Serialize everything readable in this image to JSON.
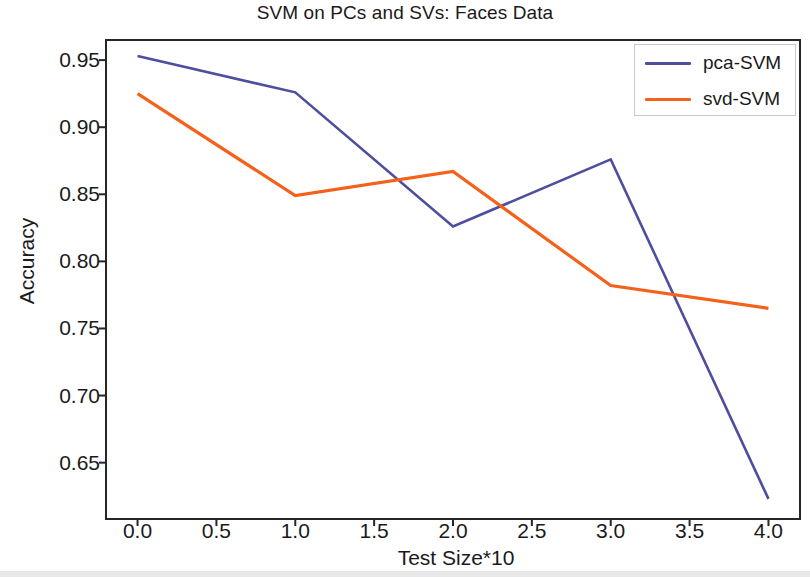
{
  "figure": {
    "width": 810,
    "height": 577,
    "background": "#ffffff"
  },
  "chart_data": {
    "type": "line",
    "title": "SVM on PCs and SVs: Faces Data",
    "xlabel": "Test Size*10",
    "ylabel": "Accuracy",
    "x": [
      0.0,
      1.0,
      2.0,
      3.0,
      4.0
    ],
    "series": [
      {
        "name": "pca-SVM",
        "color": "#4e4e9e",
        "values": [
          0.953,
          0.926,
          0.826,
          0.876,
          0.623
        ]
      },
      {
        "name": "svd-SVM",
        "color": "#f4611a",
        "values": [
          0.925,
          0.849,
          0.867,
          0.782,
          0.765
        ]
      }
    ],
    "xlim": [
      -0.2,
      4.2
    ],
    "ylim": [
      0.608,
      0.965
    ],
    "xticks": [
      0.0,
      0.5,
      1.0,
      1.5,
      2.0,
      2.5,
      3.0,
      3.5,
      4.0
    ],
    "xtick_labels": [
      "0.0",
      "0.5",
      "1.0",
      "1.5",
      "2.0",
      "2.5",
      "3.0",
      "3.5",
      "4.0"
    ],
    "yticks": [
      0.65,
      0.7,
      0.75,
      0.8,
      0.85,
      0.9,
      0.95
    ],
    "ytick_labels": [
      "0.65",
      "0.70",
      "0.75",
      "0.80",
      "0.85",
      "0.90",
      "0.95"
    ],
    "grid": false,
    "legend_position": "upper right",
    "legend_entries": [
      "pca-SVM",
      "svd-SVM"
    ]
  },
  "plot_area": {
    "left": 106,
    "top": 40,
    "right": 800,
    "bottom": 519,
    "axis_color": "#262626",
    "axis_width": 2
  }
}
